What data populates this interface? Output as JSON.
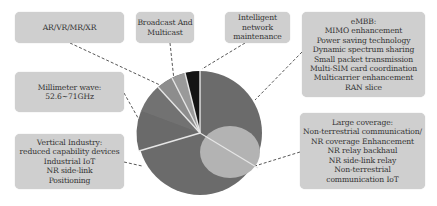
{
  "diagram": {
    "type": "pie-with-callouts",
    "colors": {
      "box_fill": "#cfcfcf",
      "slice_dark": "#6b6b6b",
      "slice_black": "#141414",
      "slice_light": "#9a9a9a",
      "inner_ellipse": "#b3b3b3",
      "separator": "#e6e6e6"
    },
    "callouts": {
      "ar_vr": {
        "lines": [
          "AR/VR/MR/XR"
        ]
      },
      "broadcast": {
        "lines": [
          "Broadcast And",
          "Multicast"
        ]
      },
      "intelligent": {
        "lines": [
          "Intelligent",
          "network",
          "maintenance"
        ]
      },
      "embb": {
        "lines": [
          "eMBB:",
          "MIMO enhancement",
          "Power saving technology",
          "Dynamic spectrum sharing",
          "Small packet transmission",
          "Multi-SIM card coordination",
          "Multicarrier enhancement",
          "RAN slice"
        ]
      },
      "mmwave": {
        "lines": [
          "Millimeter wave:",
          "52.6~71GHz"
        ]
      },
      "vertical": {
        "lines": [
          "Vertical Industry:",
          "reduced capability devices",
          "Industrial IoT",
          "NR side-link",
          "Positioning"
        ]
      },
      "coverage": {
        "lines": [
          "Large coverage:",
          "Non-terrestrial communication/",
          "NR coverage Enhancement",
          "NR relay backhaul",
          "NR side-link relay",
          "Non-terrestrial",
          "communication IoT"
        ]
      }
    }
  }
}
